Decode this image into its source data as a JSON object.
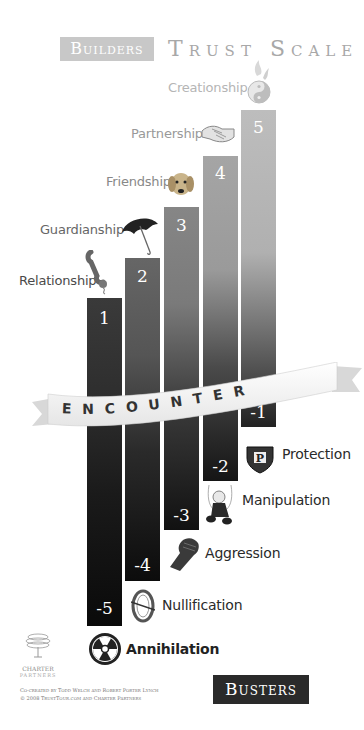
{
  "header": {
    "builders_label": "Builders",
    "title": "Trust Scale"
  },
  "banner": {
    "text": "ENCOUNTER"
  },
  "builders": [
    {
      "value": "1",
      "label": "Relationship",
      "icon": "telephone-icon"
    },
    {
      "value": "2",
      "label": "Guardianship",
      "icon": "umbrella-icon"
    },
    {
      "value": "3",
      "label": "Friendship",
      "icon": "dog-icon"
    },
    {
      "value": "4",
      "label": "Partnership",
      "icon": "handshake-icon"
    },
    {
      "value": "5",
      "label": "Creationship",
      "icon": "yin-yang-icon"
    }
  ],
  "busters": [
    {
      "value": "-1",
      "label": "Protection",
      "icon": "shield-icon"
    },
    {
      "value": "-2",
      "label": "Manipulation",
      "icon": "puppet-icon"
    },
    {
      "value": "-3",
      "label": "Aggression",
      "icon": "fist-icon"
    },
    {
      "value": "-4",
      "label": "Nullification",
      "icon": "null-ring-icon"
    },
    {
      "value": "-5",
      "label": "Annihilation",
      "icon": "radiation-icon"
    }
  ],
  "footer": {
    "busters_label": "Busters",
    "logo_line1": "CHARTER",
    "logo_line2": "PARTNERS",
    "credit_line1": "Co-created by Todd Welch and Robert Porter Lynch",
    "credit_line2": "© 2008   TrustTour.com and Charter Partners"
  },
  "colors": {
    "bar1": "#3a3a3a",
    "bar2": "#6a6a6a",
    "bar3": "#8a8a8a",
    "bar4": "#a5a5a5",
    "bar5": "#bcbcbc",
    "buster_bottom": "#111111",
    "label_builder": "#8a8a8a",
    "label_buster": "#2a2a2a"
  }
}
